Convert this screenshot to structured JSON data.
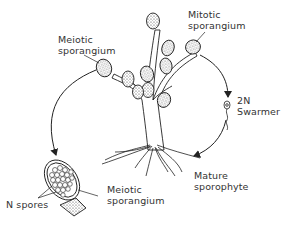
{
  "diagram": {
    "type": "life-cycle",
    "colors": {
      "ink": "#222222",
      "text": "#333333",
      "background": "#ffffff"
    },
    "labels": {
      "meiotic_sporangium_top": {
        "line1": "Meiotic",
        "line2": "sporangium"
      },
      "mitotic_sporangium": {
        "line1": "Mitotic",
        "line2": "sporangium"
      },
      "swarmer": {
        "line1": "2N",
        "line2": "Swarmer"
      },
      "mature_sporophyte": {
        "line1": "Mature",
        "line2": "sporophyte"
      },
      "meiotic_sporangium_bottom": {
        "line1": "Meiotic",
        "line2": "sporangium"
      },
      "n_spores": "N spores"
    },
    "arrows": [
      {
        "from": "meiotic sporangium (plant)",
        "to": "meiotic sporangium (enlarged)"
      },
      {
        "from": "mitotic sporangium",
        "to": "2N swarmer"
      },
      {
        "from": "2N swarmer",
        "to": "mature sporophyte"
      }
    ]
  }
}
